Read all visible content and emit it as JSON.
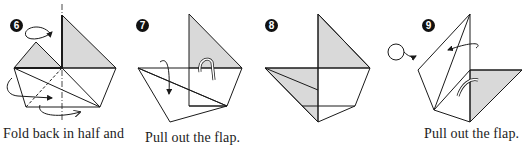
{
  "steps": [
    {
      "number": "6",
      "caption": "Fold back in half and"
    },
    {
      "number": "7",
      "caption": "Pull out the flap."
    },
    {
      "number": "8",
      "caption": ""
    },
    {
      "number": "9",
      "caption": "Pull out the flap."
    }
  ],
  "colors": {
    "line": "#1a1a1a",
    "shade": "#d9d9d9",
    "background": "#ffffff"
  },
  "icons": {
    "turn_over": "turn-over-icon"
  }
}
